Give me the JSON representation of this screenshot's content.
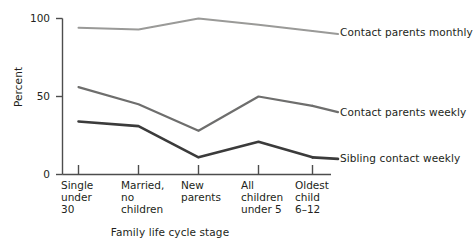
{
  "chart_data": {
    "type": "line",
    "title": "",
    "xlabel": "Family life cycle stage",
    "ylabel": "Percent",
    "ylim": [
      0,
      100
    ],
    "yticks": [
      0,
      50,
      100
    ],
    "ytick_labels": [
      "0",
      "50",
      "100"
    ],
    "grid": false,
    "legend_position": "right-inline-labels",
    "categories": [
      "Single\nunder\n30",
      "Married,\nno\nchildren",
      "New\nparents",
      "All\nchildren\nunder 5",
      "Oldest\nchild\n6–12"
    ],
    "category_lines": [
      [
        "Single",
        "under",
        "30"
      ],
      [
        "Married,",
        "no",
        "children"
      ],
      [
        "New",
        "parents"
      ],
      [
        "All",
        "children",
        "under 5"
      ],
      [
        "Oldest",
        "child",
        "6–12"
      ]
    ],
    "series": [
      {
        "name": "Contact parents monthly",
        "color": "#9a9a98",
        "width": 2.0,
        "values": [
          94,
          93,
          100,
          96,
          92
        ],
        "label_y_percent": 90
      },
      {
        "name": "Contact parents weekly",
        "color": "#6e6e6d",
        "width": 2.2,
        "values": [
          56,
          45,
          28,
          50,
          44
        ],
        "label_y_percent": 40
      },
      {
        "name": "Sibling contact weekly",
        "color": "#3b3b3b",
        "width": 2.6,
        "values": [
          34,
          31,
          11,
          21,
          11
        ],
        "label_y_percent": 10
      }
    ]
  },
  "axes": {
    "y_title": "Percent",
    "x_title": "Family life cycle stage",
    "y_tick_0": "0",
    "y_tick_50": "50",
    "y_tick_100": "100"
  },
  "series_labels": {
    "monthly": "Contact parents monthly",
    "weekly": "Contact parents weekly",
    "sibling": "Sibling contact weekly"
  },
  "categories": {
    "c0_l0": "Single",
    "c0_l1": "under",
    "c0_l2": "30",
    "c1_l0": "Married,",
    "c1_l1": "no",
    "c1_l2": "children",
    "c2_l0": "New",
    "c2_l1": "parents",
    "c2_l2": "",
    "c3_l0": "All",
    "c3_l1": "children",
    "c3_l2": "under 5",
    "c4_l0": "Oldest",
    "c4_l1": "child",
    "c4_l2": "6–12"
  },
  "colors": {
    "axis": "#4d4d4d",
    "text": "#231f20",
    "series_monthly": "#9a9a98",
    "series_weekly": "#6e6e6d",
    "series_sibling": "#3b3b3b",
    "background": "#ffffff"
  }
}
